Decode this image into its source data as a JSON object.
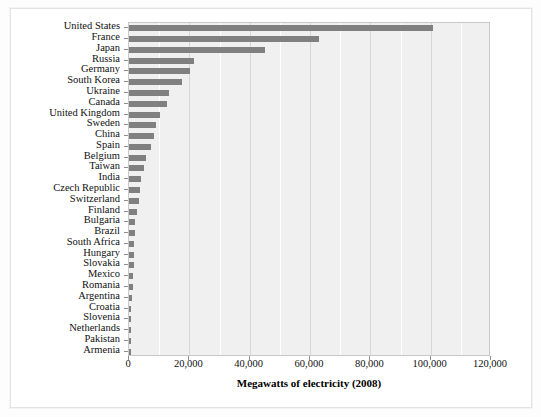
{
  "chart_data": {
    "type": "bar",
    "orientation": "horizontal",
    "title": "",
    "xlabel": "Megawatts of electricity (2008)",
    "ylabel": "",
    "xlim": [
      0,
      120000
    ],
    "xticks": [
      0,
      20000,
      40000,
      60000,
      80000,
      100000,
      120000
    ],
    "xticklabels": [
      "0",
      "20,000",
      "40,000",
      "60,000",
      "80,000",
      "100,000",
      "120,000"
    ],
    "grid": true,
    "grid_axis": "x",
    "legend": null,
    "bar_color": "#808080",
    "plot_background": "#f0f0f0",
    "categories": [
      "United States",
      "France",
      "Japan",
      "Russia",
      "Germany",
      "South Korea",
      "Ukraine",
      "Canada",
      "United Kingdom",
      "Sweden",
      "China",
      "Spain",
      "Belgium",
      "Taiwan",
      "India",
      "Czech Republic",
      "Switzerland",
      "Finland",
      "Bulgaria",
      "Brazil",
      "South Africa",
      "Hungary",
      "Slovakia",
      "Mexico",
      "Romania",
      "Argentina",
      "Croatia",
      "Slovenia",
      "Netherlands",
      "Pakistan",
      "Armenia"
    ],
    "values": [
      100700,
      63000,
      45000,
      21700,
      20300,
      17700,
      13100,
      12600,
      10200,
      9000,
      8400,
      7400,
      5800,
      4900,
      4100,
      3700,
      3200,
      2700,
      1900,
      1900,
      1800,
      1800,
      1700,
      1400,
      1300,
      1000,
      700,
      700,
      500,
      400,
      400
    ]
  },
  "axis": {
    "x_title": "Megawatts of electricity (2008)"
  }
}
